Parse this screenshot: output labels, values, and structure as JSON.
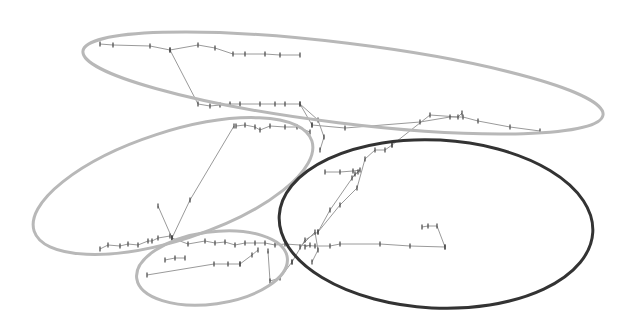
{
  "diagram": {
    "type": "clustered-trajectory",
    "background": "#ffffff",
    "colors": {
      "ellipse_light": "#b8b8b8",
      "ellipse_dark": "#333333",
      "path": "#9a9a9a",
      "tick": "#444444"
    },
    "clusters": [
      {
        "id": "top",
        "cx": 343,
        "cy": 83,
        "rx": 262,
        "ry": 40,
        "rot": 7,
        "stroke": "#b8b8b8",
        "width": 3
      },
      {
        "id": "left",
        "cx": 173,
        "cy": 186,
        "rx": 146,
        "ry": 54,
        "rot": -18,
        "stroke": "#b8b8b8",
        "width": 3
      },
      {
        "id": "bottom-small",
        "cx": 212,
        "cy": 268,
        "rx": 76,
        "ry": 36,
        "rot": -8,
        "stroke": "#b8b8b8",
        "width": 3
      },
      {
        "id": "right-dark",
        "cx": 436,
        "cy": 224,
        "rx": 157,
        "ry": 84,
        "rot": 3,
        "stroke": "#333333",
        "width": 3
      }
    ],
    "paths": [
      [
        [
          100,
          44
        ],
        [
          113,
          45
        ],
        [
          150,
          46
        ],
        [
          170,
          50
        ],
        [
          198,
          45
        ],
        [
          215,
          48
        ],
        [
          233,
          54
        ],
        [
          245,
          54
        ],
        [
          265,
          54
        ],
        [
          280,
          55
        ],
        [
          300,
          55
        ]
      ],
      [
        [
          170,
          50
        ],
        [
          198,
          104
        ],
        [
          210,
          106
        ],
        [
          220,
          105
        ],
        [
          230,
          104
        ],
        [
          240,
          104
        ],
        [
          260,
          104
        ],
        [
          275,
          104
        ],
        [
          285,
          104
        ],
        [
          300,
          104
        ],
        [
          312,
          125
        ]
      ],
      [
        [
          312,
          125
        ],
        [
          345,
          128
        ],
        [
          420,
          122
        ],
        [
          450,
          117
        ],
        [
          463,
          117
        ],
        [
          478,
          121
        ],
        [
          510,
          127
        ],
        [
          540,
          131
        ]
      ],
      [
        [
          300,
          104
        ],
        [
          318,
          120
        ],
        [
          324,
          137
        ],
        [
          320,
          150
        ]
      ],
      [
        [
          236,
          126
        ],
        [
          245,
          125
        ],
        [
          255,
          127
        ],
        [
          260,
          130
        ],
        [
          270,
          126
        ],
        [
          285,
          127
        ],
        [
          297,
          127
        ],
        [
          310,
          132
        ]
      ],
      [
        [
          234,
          126
        ],
        [
          190,
          200
        ],
        [
          172,
          238
        ]
      ],
      [
        [
          158,
          206
        ],
        [
          172,
          238
        ]
      ],
      [
        [
          100,
          249
        ],
        [
          108,
          245
        ],
        [
          120,
          246
        ],
        [
          128,
          244
        ],
        [
          138,
          245
        ],
        [
          148,
          241
        ],
        [
          152,
          241
        ],
        [
          158,
          238
        ],
        [
          170,
          236
        ]
      ],
      [
        [
          172,
          238
        ],
        [
          188,
          244
        ],
        [
          205,
          241
        ],
        [
          215,
          243
        ],
        [
          225,
          242
        ],
        [
          235,
          245
        ],
        [
          245,
          243
        ],
        [
          255,
          243
        ],
        [
          265,
          243
        ],
        [
          275,
          245
        ],
        [
          285,
          244
        ],
        [
          315,
          246
        ],
        [
          330,
          246
        ],
        [
          340,
          244
        ],
        [
          380,
          244
        ],
        [
          410,
          246
        ],
        [
          445,
          247
        ]
      ],
      [
        [
          305,
          247
        ],
        [
          310,
          245
        ]
      ],
      [
        [
          445,
          247
        ],
        [
          437,
          226
        ],
        [
          428,
          226
        ],
        [
          422,
          227
        ]
      ],
      [
        [
          147,
          275
        ],
        [
          214,
          264
        ],
        [
          228,
          264
        ],
        [
          240,
          264
        ]
      ],
      [
        [
          240,
          264
        ],
        [
          252,
          255
        ],
        [
          258,
          250
        ]
      ],
      [
        [
          268,
          251
        ],
        [
          270,
          281
        ],
        [
          280,
          278
        ],
        [
          292,
          262
        ]
      ],
      [
        [
          292,
          262
        ],
        [
          305,
          240
        ],
        [
          318,
          232
        ],
        [
          340,
          205
        ],
        [
          357,
          188
        ],
        [
          365,
          159
        ],
        [
          375,
          150
        ],
        [
          385,
          150
        ],
        [
          392,
          145
        ]
      ],
      [
        [
          392,
          145
        ],
        [
          430,
          115
        ],
        [
          458,
          117
        ],
        [
          462,
          113
        ]
      ],
      [
        [
          300,
          247
        ],
        [
          315,
          232
        ],
        [
          318,
          250
        ],
        [
          312,
          262
        ]
      ],
      [
        [
          318,
          232
        ],
        [
          330,
          210
        ],
        [
          355,
          174
        ],
        [
          358,
          172
        ]
      ],
      [
        [
          325,
          172
        ],
        [
          340,
          172
        ],
        [
          353,
          171
        ],
        [
          360,
          170
        ],
        [
          352,
          178
        ]
      ],
      [
        [
          165,
          260
        ],
        [
          175,
          258
        ],
        [
          185,
          258
        ]
      ]
    ]
  }
}
